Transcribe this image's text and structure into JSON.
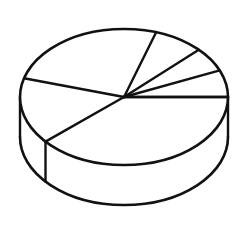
{
  "chart_data": {
    "type": "pie",
    "title": "",
    "subtitle": "",
    "xlabel": "",
    "ylabel": "",
    "style": "3d-pie-line-drawing",
    "legend": "none",
    "grid": false,
    "labels_shown": false,
    "value_labels": [],
    "categories": [
      "Slice 1",
      "Slice 2",
      "Slice 3",
      "Slice 4",
      "Slice 5",
      "Slice 6"
    ],
    "values": [
      6.4,
      5.8,
      7.8,
      25.6,
      15.8,
      38.6
    ],
    "units": "percent",
    "slice_angles_deg": [
      23,
      21,
      28,
      92,
      57,
      139
    ],
    "boundary_angles_deg": [
      0,
      23,
      44,
      72,
      164,
      221,
      360
    ],
    "slices": [
      {
        "name": "Slice 1",
        "value": 6.4,
        "angle_deg": 23,
        "start_deg": 0,
        "end_deg": 23,
        "fill": "#ffffff",
        "stroke": "#111111"
      },
      {
        "name": "Slice 2",
        "value": 5.8,
        "angle_deg": 21,
        "start_deg": 23,
        "end_deg": 44,
        "fill": "#ffffff",
        "stroke": "#111111"
      },
      {
        "name": "Slice 3",
        "value": 7.8,
        "angle_deg": 28,
        "start_deg": 44,
        "end_deg": 72,
        "fill": "#ffffff",
        "stroke": "#111111"
      },
      {
        "name": "Slice 4",
        "value": 25.6,
        "angle_deg": 92,
        "start_deg": 72,
        "end_deg": 164,
        "fill": "#ffffff",
        "stroke": "#111111"
      },
      {
        "name": "Slice 5",
        "value": 15.8,
        "angle_deg": 57,
        "start_deg": 164,
        "end_deg": 221,
        "fill": "#ffffff",
        "stroke": "#111111"
      },
      {
        "name": "Slice 6",
        "value": 38.6,
        "angle_deg": 139,
        "start_deg": 221,
        "end_deg": 360,
        "fill": "#ffffff",
        "stroke": "#111111"
      }
    ],
    "geometry": {
      "center_x": 124,
      "center_y": 97,
      "radius_x": 104,
      "radius_y": 68,
      "depth": 40,
      "stroke_width": 2.4,
      "background": "#ffffff",
      "stroke_color": "#111111"
    }
  },
  "figure": {
    "alt_text": "3D pie chart line drawing with six wedges, no labels",
    "background_color": "#ffffff",
    "line_color": "#111111"
  }
}
